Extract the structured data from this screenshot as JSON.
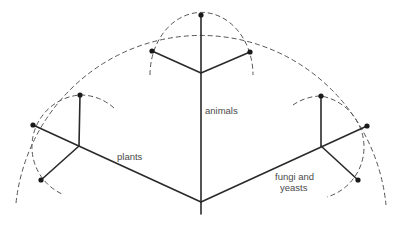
{
  "diagram": {
    "type": "phylogenetic-tree",
    "labels": {
      "animals": "animals",
      "plants": "plants",
      "fungi_line1": "fungi and",
      "fungi_line2": "yeasts"
    },
    "colors": {
      "line": "#2a2a2a",
      "dashed": "#555555",
      "text": "#4a4a4a",
      "background": "#ffffff"
    },
    "nodes": {
      "root": [
        201,
        202
      ],
      "stem_end": [
        201,
        214
      ],
      "animals_junction": [
        201,
        73
      ],
      "animals_top": [
        201,
        15
      ],
      "animals_left": [
        152,
        51
      ],
      "animals_right": [
        250,
        52
      ],
      "plants_junction": [
        79,
        146
      ],
      "plants_top": [
        80,
        95
      ],
      "plants_left": [
        33,
        125
      ],
      "plants_bottom": [
        41,
        180
      ],
      "fungi_junction": [
        321,
        146
      ],
      "fungi_top": [
        321,
        96
      ],
      "fungi_right": [
        367,
        126
      ],
      "fungi_bottom": [
        358,
        180
      ]
    }
  }
}
